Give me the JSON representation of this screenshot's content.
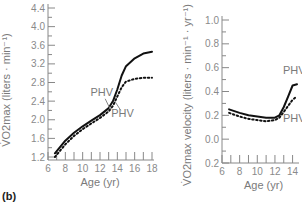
{
  "panel_label": "(b)",
  "chart_data": [
    {
      "type": "line",
      "title": "",
      "xlabel": "Age (yr)",
      "ylabel": "V̇O2max (liters · min⁻¹)",
      "xlim": [
        6,
        18
      ],
      "ylim": [
        1.2,
        4.4
      ],
      "xticks": [
        6,
        8,
        10,
        12,
        14,
        16,
        18
      ],
      "yticks": [
        1.2,
        1.6,
        2.0,
        2.4,
        2.8,
        3.2,
        3.6,
        4.0,
        4.4
      ],
      "grid": false,
      "series": [
        {
          "name": "solid",
          "style": "solid",
          "x": [
            6.8,
            8,
            9,
            10,
            11,
            12,
            13,
            13.5,
            14,
            14.5,
            15,
            16,
            17,
            18
          ],
          "y": [
            1.28,
            1.55,
            1.72,
            1.86,
            1.98,
            2.1,
            2.25,
            2.4,
            2.65,
            2.95,
            3.15,
            3.32,
            3.42,
            3.46
          ]
        },
        {
          "name": "dotted",
          "style": "dotted",
          "x": [
            6.8,
            8,
            9,
            10,
            11,
            12,
            13,
            13.5,
            14,
            14.5,
            15,
            16,
            17,
            18
          ],
          "y": [
            1.2,
            1.47,
            1.65,
            1.8,
            1.92,
            2.04,
            2.18,
            2.3,
            2.5,
            2.7,
            2.82,
            2.88,
            2.9,
            2.9
          ]
        }
      ],
      "annotations": [
        {
          "text": "PHV",
          "at": [
            12.2,
            2.5
          ],
          "points_to": "solid"
        },
        {
          "text": "PHV",
          "at": [
            14.6,
            2.05
          ],
          "points_to": "dotted"
        }
      ]
    },
    {
      "type": "line",
      "title": "",
      "xlabel": "Age (yr)",
      "ylabel": "V̇O2max velocity (liters · min⁻¹ · yr⁻¹)",
      "xlim": [
        6,
        14.5
      ],
      "ylim": [
        -0.2,
        1.0
      ],
      "xticks": [
        6,
        8,
        10,
        12,
        14
      ],
      "yticks": [
        -0.2,
        0.0,
        0.2,
        0.4,
        0.6,
        0.8,
        1.0
      ],
      "ytick_labels": [
        "0.2",
        "0.0",
        "0.2",
        "0.4",
        "0.6",
        "0.8",
        "1.0"
      ],
      "grid": false,
      "series": [
        {
          "name": "solid",
          "style": "solid",
          "x": [
            6.8,
            8,
            9,
            10,
            11,
            12,
            12.5,
            13,
            13.5,
            14,
            14.5
          ],
          "y": [
            0.25,
            0.22,
            0.2,
            0.19,
            0.18,
            0.18,
            0.2,
            0.27,
            0.36,
            0.45,
            0.46
          ]
        },
        {
          "name": "dotted",
          "style": "dotted",
          "x": [
            6.8,
            8,
            9,
            10,
            11,
            12,
            12.5,
            13,
            13.5,
            14,
            14.5
          ],
          "y": [
            0.22,
            0.19,
            0.17,
            0.16,
            0.15,
            0.16,
            0.18,
            0.23,
            0.28,
            0.33,
            0.36
          ]
        }
      ],
      "annotations": [
        {
          "text": "PHV",
          "at": [
            14.2,
            0.55
          ],
          "points_to": "solid"
        },
        {
          "text": "PHV",
          "at": [
            14.2,
            0.14
          ],
          "points_to": "dotted"
        }
      ]
    }
  ]
}
